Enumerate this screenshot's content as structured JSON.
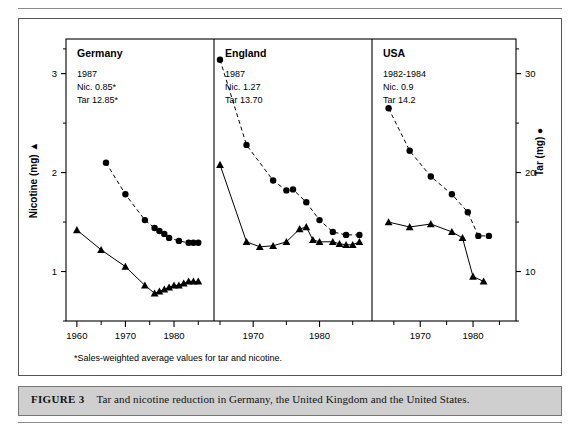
{
  "figure": {
    "label": "FIGURE 3",
    "caption": "Tar and nicotine reduction in Germany, the United Kingdom and the United States.",
    "footnote": "*Sales-weighted average values for tar and nicotine."
  },
  "axes": {
    "left_title": "Nicotine (mg)",
    "left_marker": "▲",
    "right_title": "Tar (mg)",
    "right_marker": "●",
    "left_ticks": [
      "1",
      "2",
      "3"
    ],
    "right_ticks": [
      "10",
      "20",
      "30"
    ]
  },
  "panels": [
    {
      "name": "Germany",
      "year": "1987",
      "nicotine": "Nic. 0.85*",
      "tar": "Tar 12.85*",
      "xticks": [
        "1960",
        "1970",
        "1980"
      ]
    },
    {
      "name": "England",
      "year": "1987",
      "nicotine": "Nic. 1.27",
      "tar": "Tar 13.70",
      "xticks": [
        "1970",
        "1980"
      ]
    },
    {
      "name": "USA",
      "year": "1982-1984",
      "nicotine": "Nic. 0.9",
      "tar": "Tar 14.2",
      "xticks": [
        "1970",
        "1980"
      ]
    }
  ],
  "chart_data": {
    "type": "line",
    "title": "Tar and nicotine reduction in Germany, the United Kingdom and the United States",
    "xlabel": "Year",
    "ylabel": "Nicotine (mg)",
    "y2label": "Tar (mg)",
    "ylim": [
      0.5,
      3.35
    ],
    "y2lim": [
      5,
      33.5
    ],
    "grid": false,
    "legend": "none",
    "note": "Left axis nicotine (mg), triangles + solid line. Right axis tar (mg), circles + dashed line. Tar mg = nicotine-axis value x 10.",
    "panels": [
      {
        "name": "Germany",
        "xlim": [
          1959,
          1987
        ],
        "xticks": [
          1960,
          1970,
          1980
        ],
        "series": [
          {
            "name": "Tar",
            "marker": "circle",
            "line": "dashed",
            "axis": "right",
            "x": [
              1966,
              1970,
              1974,
              1976,
              1977,
              1978,
              1979,
              1981,
              1983,
              1984,
              1985
            ],
            "y": [
              21.0,
              17.8,
              15.2,
              14.4,
              14.1,
              13.8,
              13.4,
              13.1,
              12.9,
              12.9,
              12.9
            ]
          },
          {
            "name": "Nicotine",
            "marker": "triangle",
            "line": "solid",
            "axis": "left",
            "x": [
              1960,
              1965,
              1970,
              1974,
              1976,
              1977,
              1978,
              1979,
              1980,
              1981,
              1982,
              1983,
              1984,
              1985
            ],
            "y": [
              1.42,
              1.22,
              1.05,
              0.86,
              0.78,
              0.8,
              0.82,
              0.84,
              0.86,
              0.86,
              0.88,
              0.9,
              0.9,
              0.9
            ]
          }
        ]
      },
      {
        "name": "England",
        "xlim": [
          1965,
          1987
        ],
        "xticks": [
          1970,
          1980
        ],
        "series": [
          {
            "name": "Tar",
            "marker": "circle",
            "line": "dashed",
            "axis": "right",
            "x": [
              1965,
              1969,
              1973,
              1975,
              1976,
              1978,
              1980,
              1982,
              1984,
              1986
            ],
            "y": [
              31.4,
              22.8,
              19.2,
              18.2,
              18.3,
              17.0,
              15.2,
              14.0,
              13.7,
              13.7
            ]
          },
          {
            "name": "Nicotine",
            "marker": "triangle",
            "line": "solid",
            "axis": "left",
            "x": [
              1965,
              1969,
              1971,
              1973,
              1975,
              1977,
              1978,
              1979,
              1980,
              1982,
              1983,
              1984,
              1985,
              1986
            ],
            "y": [
              2.08,
              1.3,
              1.25,
              1.26,
              1.3,
              1.43,
              1.45,
              1.32,
              1.3,
              1.3,
              1.28,
              1.27,
              1.27,
              1.3
            ]
          }
        ]
      },
      {
        "name": "USA",
        "xlim": [
          1962,
          1987
        ],
        "xticks": [
          1970,
          1980
        ],
        "series": [
          {
            "name": "Tar",
            "marker": "circle",
            "line": "dashed",
            "axis": "right",
            "x": [
              1964,
              1968,
              1972,
              1976,
              1979,
              1981,
              1983
            ],
            "y": [
              26.5,
              22.2,
              19.6,
              17.8,
              16.0,
              13.6,
              13.6
            ]
          },
          {
            "name": "Nicotine",
            "marker": "triangle",
            "line": "solid",
            "axis": "left",
            "x": [
              1964,
              1968,
              1972,
              1976,
              1978,
              1980,
              1982
            ],
            "y": [
              1.5,
              1.45,
              1.48,
              1.4,
              1.34,
              0.95,
              0.9
            ]
          }
        ]
      }
    ]
  }
}
